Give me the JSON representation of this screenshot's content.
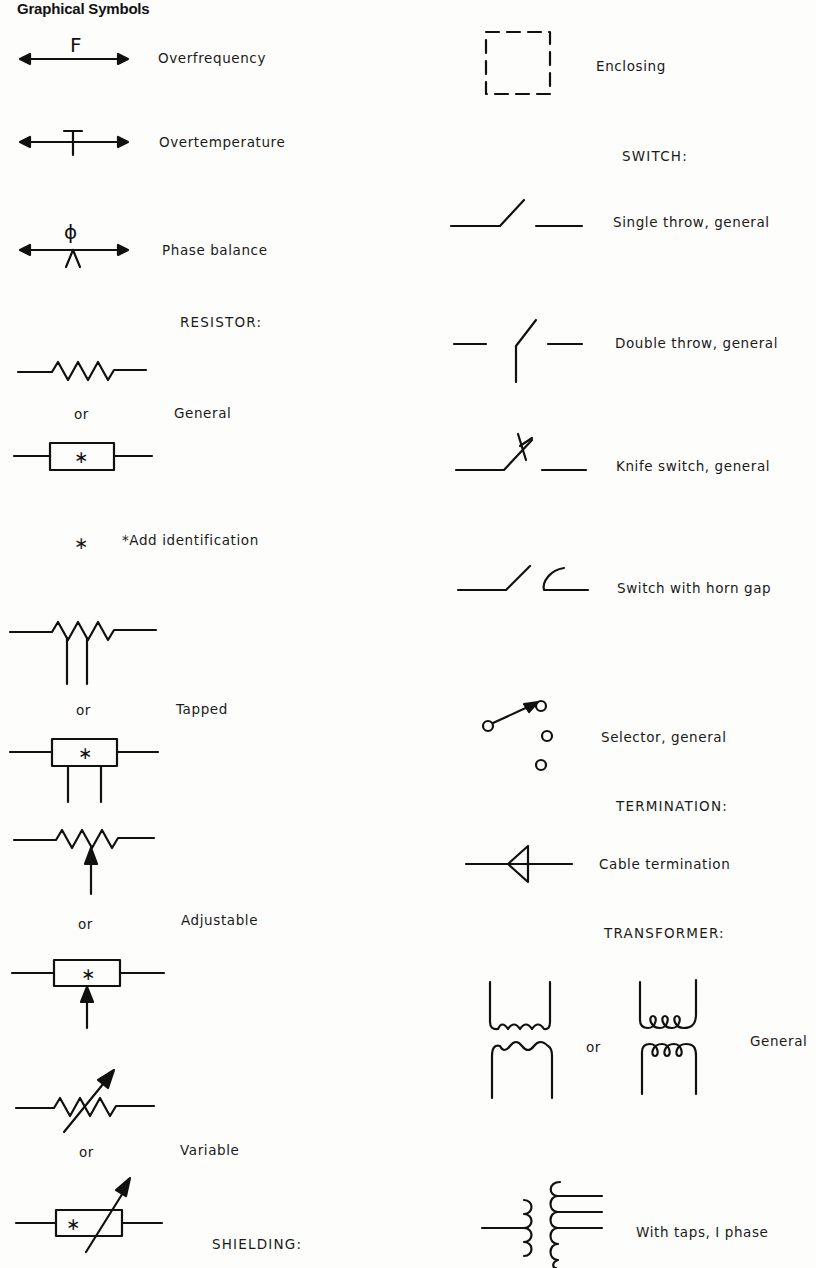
{
  "page": {
    "title": "Graphical Symbols"
  },
  "left_column": {
    "overfrequency": {
      "symbol_letter": "F",
      "label": "Overfrequency"
    },
    "overtemperature": {
      "label": "Overtemperature"
    },
    "phase_balance": {
      "symbol_letter": "ϕ",
      "label": "Phase balance"
    },
    "resistor": {
      "heading": "RESISTOR:",
      "general": {
        "or": "or",
        "label": "General"
      },
      "note": {
        "symbol": "∗",
        "text": "*Add identification"
      },
      "tapped": {
        "or": "or",
        "label": "Tapped"
      },
      "adjustable": {
        "or": "or",
        "label": "Adjustable"
      },
      "variable": {
        "or": "or",
        "label": "Variable"
      }
    },
    "shielding": {
      "heading": "SHIELDING:"
    }
  },
  "right_column": {
    "enclosing": {
      "label": "Enclosing"
    },
    "switch": {
      "heading": "SWITCH:",
      "items": [
        {
          "label": "Single throw, general"
        },
        {
          "label": "Double throw, general"
        },
        {
          "label": "Knife switch, general"
        },
        {
          "label": "Switch with horn gap"
        },
        {
          "label": "Selector, general"
        }
      ]
    },
    "termination": {
      "heading": "TERMINATION:",
      "cable": {
        "label": "Cable termination"
      }
    },
    "transformer": {
      "heading": "TRANSFORMER:",
      "general": {
        "or": "or",
        "label": "General"
      },
      "taps": {
        "label": "With taps, I phase"
      }
    }
  },
  "colors": {
    "ink": "#111111",
    "paper": "#fdfdfb"
  }
}
